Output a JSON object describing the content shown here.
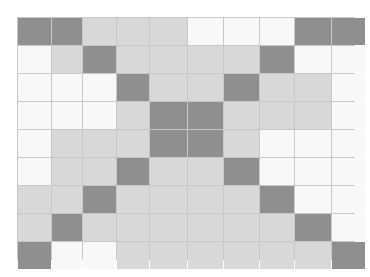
{
  "grid": {
    "rows": 9,
    "cols": 10,
    "legend": {
      "D": "dark",
      "L": "light",
      "W": "white"
    },
    "colors": {
      "D": "#8f8f8f",
      "L": "#d8d8d8",
      "W": "#f8f8f8",
      "line": "#c8c8c8"
    },
    "cells": [
      [
        "D",
        "D",
        "L",
        "L",
        "L",
        "W",
        "W",
        "W",
        "D",
        "D"
      ],
      [
        "W",
        "L",
        "D",
        "L",
        "L",
        "L",
        "L",
        "D",
        "W",
        "W"
      ],
      [
        "W",
        "W",
        "W",
        "D",
        "L",
        "L",
        "D",
        "L",
        "L",
        "W"
      ],
      [
        "W",
        "W",
        "W",
        "L",
        "D",
        "D",
        "L",
        "L",
        "L",
        "W"
      ],
      [
        "W",
        "L",
        "L",
        "L",
        "D",
        "D",
        "L",
        "W",
        "W",
        "W"
      ],
      [
        "W",
        "L",
        "L",
        "D",
        "L",
        "L",
        "D",
        "W",
        "W",
        "W"
      ],
      [
        "L",
        "L",
        "D",
        "L",
        "L",
        "L",
        "L",
        "D",
        "W",
        "W"
      ],
      [
        "L",
        "D",
        "L",
        "L",
        "L",
        "L",
        "L",
        "L",
        "D",
        "W"
      ],
      [
        "D",
        "W",
        "W",
        "L",
        "L",
        "L",
        "L",
        "L",
        "L",
        "D"
      ]
    ]
  }
}
